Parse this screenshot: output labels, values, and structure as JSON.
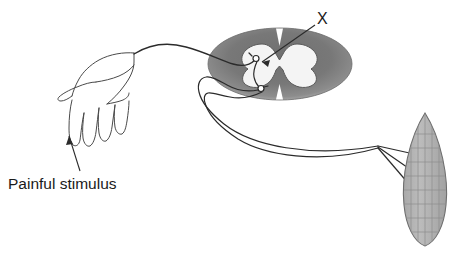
{
  "figure": {
    "background_color": "#ffffff",
    "width": 458,
    "height": 256
  },
  "labels": {
    "stimulus": "Painful stimulus",
    "structure_x": "X"
  },
  "colors": {
    "outline": "#3a3a3a",
    "white_matter": "#7d7d7d",
    "white_matter_rim": "#a8a8a8",
    "gray_matter": "#f2f2f2",
    "muscle_fill": "#b2b2b2",
    "muscle_stroke": "#6e6e6e",
    "muscle_striation": "#8c8c8c",
    "text": "#1a1a1a",
    "nerve": "#2b2b2b"
  },
  "parts": {
    "hand": {
      "name": "hand",
      "description": "outline drawing of a hand receiving the painful stimulus"
    },
    "spinal_cord": {
      "name": "spinal-cord-cross-section",
      "description": "transverse section of spinal cord with butterfly-shaped gray matter"
    },
    "interneuron": {
      "name": "interneuron",
      "description": "connecting neuron in dorsal horn marked X"
    },
    "sensory_neuron": {
      "name": "sensory-afferent-nerve",
      "description": "afferent fibre running from hand to dorsal horn"
    },
    "motor_neuron": {
      "name": "motor-efferent-nerve",
      "description": "efferent fibre running from ventral horn to muscle"
    },
    "muscle": {
      "name": "effector-muscle",
      "description": "striated effector muscle with three nerve branches"
    }
  },
  "pointers": {
    "stimulus_leader": "arrow from 'Painful stimulus' text up to fingertip",
    "x_leader": "leader line from 'X' down-left to interneuron"
  }
}
